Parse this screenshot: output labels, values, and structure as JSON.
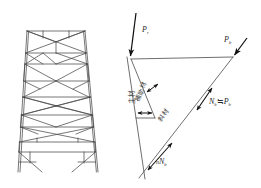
{
  "figure": {
    "title": "",
    "type": "engineering-force-diagram"
  },
  "left_panel": {
    "name": "transmission tower truss elevation",
    "description": "steel lattice tower side view with cross bracing"
  },
  "right_panel": {
    "name": "member force free-body diagram",
    "labels": {
      "main_member": "主材",
      "auxiliary_member": "補助材",
      "diagonal_member": "斜材"
    },
    "forces": {
      "top_left": {
        "symbol": "P",
        "subscript": "r"
      },
      "top_right": {
        "symbol": "P",
        "subscript": "b"
      },
      "mid_right": {
        "symbol": "N",
        "subscript": "b",
        "relation": "≒",
        "symbol2": "P",
        "subscript2": "b"
      },
      "bottom": {
        "prefix": "n",
        "symbol": "N",
        "subscript": "b"
      }
    }
  },
  "colors": {
    "line": "#4a4a4a",
    "arrow": "#1a1a1a",
    "text": "#2a2a2a",
    "background": "#ffffff"
  }
}
